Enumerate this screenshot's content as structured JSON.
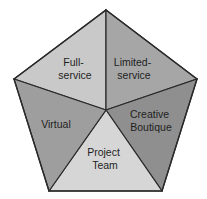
{
  "diagram": {
    "type": "pentagon-segmented",
    "center": [
      106,
      110
    ],
    "vertices": {
      "top": [
        106,
        10
      ],
      "right": [
        197,
        79
      ],
      "bottom_right": [
        162,
        191
      ],
      "bottom_left": [
        49,
        191
      ],
      "left": [
        14,
        79
      ]
    },
    "segments": [
      {
        "id": "full-service",
        "lines": [
          "Full-",
          "service"
        ],
        "color": "#c9c9c9",
        "label_pos": [
          75,
          66
        ]
      },
      {
        "id": "limited-service",
        "lines": [
          "Limited-",
          "service"
        ],
        "color": "#a6a6a6",
        "label_pos": [
          134,
          66
        ]
      },
      {
        "id": "creative-boutique",
        "lines": [
          "Creative",
          "Boutique"
        ],
        "color": "#8f8f8f",
        "label_pos": [
          151,
          118
        ]
      },
      {
        "id": "project-team",
        "lines": [
          "Project",
          "Team"
        ],
        "color": "#d6d6d6",
        "label_pos": [
          105,
          156
        ]
      },
      {
        "id": "virtual",
        "lines": [
          "Virtual"
        ],
        "color": "#9e9e9e",
        "label_pos": [
          56,
          127
        ]
      }
    ]
  }
}
